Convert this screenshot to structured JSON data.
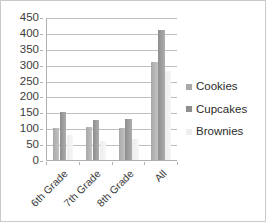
{
  "chart_data": {
    "type": "bar",
    "title": "",
    "xlabel": "",
    "ylabel": "",
    "ylim": [
      0,
      450
    ],
    "y_ticks": [
      0,
      50,
      100,
      150,
      200,
      250,
      300,
      350,
      400,
      450
    ],
    "grid": true,
    "legend_position": "right",
    "categories": [
      "6th Grade",
      "7th Grade",
      "8th Grade",
      "All"
    ],
    "series": [
      {
        "name": "Cookies",
        "color": "#a8a8a8",
        "values": [
          100,
          105,
          100,
          310
        ]
      },
      {
        "name": "Cupcakes",
        "color": "#8e8e8e",
        "values": [
          150,
          125,
          130,
          410
        ]
      },
      {
        "name": "Brownies",
        "color": "#ededed",
        "values": [
          80,
          60,
          65,
          280
        ]
      }
    ]
  },
  "axis": {
    "y_tick_labels": [
      "450",
      "400",
      "350",
      "300",
      "250",
      "200",
      "150",
      "100",
      "50",
      "0"
    ],
    "x_tick_labels": [
      "6th Grade",
      "7th Grade",
      "8th Grade",
      "All"
    ]
  },
  "legend": {
    "items": [
      {
        "label": "Cookies"
      },
      {
        "label": "Cupcakes"
      },
      {
        "label": "Brownies"
      }
    ]
  }
}
